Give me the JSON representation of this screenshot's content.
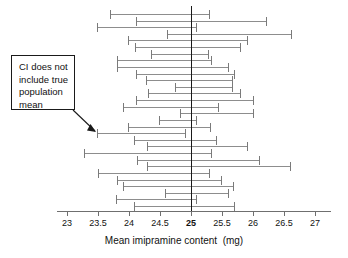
{
  "chart_data": {
    "type": "scatter",
    "title": "",
    "xlabel": "Mean imipramine content  (mg)",
    "ylabel": "",
    "xlim": [
      22.75,
      27.25
    ],
    "ylim": [
      0,
      31
    ],
    "grid": false,
    "legend": null,
    "tick_labels": [
      "23",
      "23.5",
      "24",
      "24.5",
      "25",
      "25.5",
      "26",
      "26.5",
      "27"
    ],
    "tick_values": [
      23,
      23.5,
      24,
      24.5,
      25,
      25.5,
      26,
      26.5,
      27
    ],
    "bold_tick_value": 25,
    "reference_line": {
      "name": "true-population-mean",
      "value": 25,
      "color": "#1a1a1a"
    },
    "series": [
      {
        "name": "95% confidence intervals",
        "color": "#8d8d8d",
        "marker": "error-bar",
        "intervals": [
          {
            "index": 1,
            "low": 23.69,
            "high": 25.31,
            "includes_true_mean": true
          },
          {
            "index": 2,
            "low": 24.11,
            "high": 26.23,
            "includes_true_mean": true
          },
          {
            "index": 3,
            "low": 23.48,
            "high": 25.1,
            "includes_true_mean": true
          },
          {
            "index": 4,
            "low": 24.61,
            "high": 26.63,
            "includes_true_mean": true
          },
          {
            "index": 5,
            "low": 23.98,
            "high": 25.92,
            "includes_true_mean": true
          },
          {
            "index": 6,
            "low": 24.1,
            "high": 25.81,
            "includes_true_mean": true
          },
          {
            "index": 7,
            "low": 24.35,
            "high": 25.29,
            "includes_true_mean": true
          },
          {
            "index": 8,
            "low": 23.81,
            "high": 25.34,
            "includes_true_mean": true
          },
          {
            "index": 9,
            "low": 23.81,
            "high": 25.61,
            "includes_true_mean": true
          },
          {
            "index": 10,
            "low": 24.11,
            "high": 25.71,
            "includes_true_mean": true
          },
          {
            "index": 11,
            "low": 24.27,
            "high": 25.68,
            "includes_true_mean": true
          },
          {
            "index": 12,
            "low": 24.74,
            "high": 25.68,
            "includes_true_mean": true
          },
          {
            "index": 13,
            "low": 24.31,
            "high": 25.81,
            "includes_true_mean": true
          },
          {
            "index": 14,
            "low": 24.11,
            "high": 26.02,
            "includes_true_mean": true
          },
          {
            "index": 15,
            "low": 23.9,
            "high": 25.45,
            "includes_true_mean": true
          },
          {
            "index": 16,
            "low": 24.82,
            "high": 26.02,
            "includes_true_mean": true
          },
          {
            "index": 17,
            "low": 24.48,
            "high": 25.1,
            "includes_true_mean": true
          },
          {
            "index": 18,
            "low": 23.98,
            "high": 25.32,
            "includes_true_mean": true
          },
          {
            "index": 19,
            "low": 23.48,
            "high": 24.92,
            "includes_true_mean": false
          },
          {
            "index": 20,
            "low": 24.08,
            "high": 25.42,
            "includes_true_mean": true
          },
          {
            "index": 21,
            "low": 24.29,
            "high": 25.92,
            "includes_true_mean": true
          },
          {
            "index": 22,
            "low": 23.27,
            "high": 25.34,
            "includes_true_mean": true
          },
          {
            "index": 23,
            "low": 24.13,
            "high": 26.11,
            "includes_true_mean": true
          },
          {
            "index": 24,
            "low": 24.29,
            "high": 26.61,
            "includes_true_mean": true
          },
          {
            "index": 25,
            "low": 23.5,
            "high": 25.31,
            "includes_true_mean": true
          },
          {
            "index": 26,
            "low": 23.81,
            "high": 25.5,
            "includes_true_mean": true
          },
          {
            "index": 27,
            "low": 23.9,
            "high": 25.69,
            "includes_true_mean": true
          },
          {
            "index": 28,
            "low": 24.58,
            "high": 25.61,
            "includes_true_mean": true
          },
          {
            "index": 29,
            "low": 23.79,
            "high": 25.1,
            "includes_true_mean": true
          },
          {
            "index": 30,
            "low": 24.08,
            "high": 25.71,
            "includes_true_mean": true
          }
        ]
      }
    ],
    "annotations": [
      {
        "name": "ci-does-not-include-true-mean-callout",
        "lines": [
          "CI does not",
          "include true",
          "population",
          "mean"
        ],
        "points_to_interval_index": 19
      }
    ]
  },
  "axis": {
    "title": "Mean imipramine content  (mg)"
  },
  "annotation": {
    "line1": "CI does not",
    "line2": "include true",
    "line3": "population",
    "line4": "mean"
  },
  "colors": {
    "ci": "#8d8d8d",
    "reference_line": "#1a1a1a",
    "axis": "#6f6f6f",
    "text": "#111111",
    "background": "#ffffff"
  }
}
